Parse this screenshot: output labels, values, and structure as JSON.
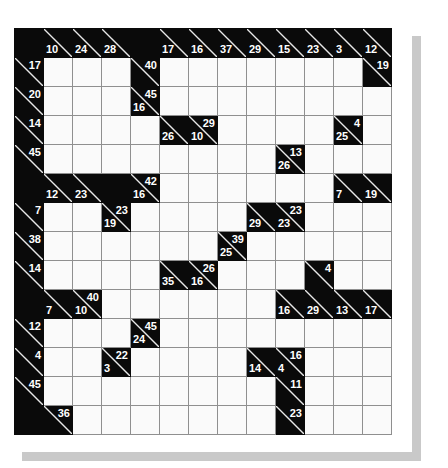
{
  "puzzle": {
    "type": "kakuro",
    "title": "Kakuro Grid",
    "rows": 14,
    "cols": 13,
    "cell_size_px": 29,
    "colors": {
      "block": "#0a0a0a",
      "cell": "#fafafa",
      "grid_line": "#8f8f8f",
      "clue_text": "#ffffff",
      "shadow": "#c9c9c9",
      "page_background": "#ffffff"
    },
    "legend": {
      "right_clue_note": "number in upper-right of a black cell is the sum of the horizontal run to its right",
      "down_clue_note": "number in lower-left of a black cell is the sum of the vertical run below it"
    },
    "grid": [
      [
        {
          "t": "block"
        },
        {
          "t": "clue",
          "down": "10"
        },
        {
          "t": "clue",
          "down": "24"
        },
        {
          "t": "clue",
          "down": "28"
        },
        {
          "t": "block"
        },
        {
          "t": "clue",
          "down": "17"
        },
        {
          "t": "clue",
          "down": "16"
        },
        {
          "t": "clue",
          "down": "37"
        },
        {
          "t": "clue",
          "down": "29"
        },
        {
          "t": "clue",
          "down": "15"
        },
        {
          "t": "clue",
          "down": "23"
        },
        {
          "t": "clue",
          "down": "3"
        },
        {
          "t": "clue",
          "down": "12"
        }
      ],
      [
        {
          "t": "clue",
          "right": "17"
        },
        {
          "t": "cell"
        },
        {
          "t": "cell"
        },
        {
          "t": "cell"
        },
        {
          "t": "clue",
          "right": "40"
        },
        {
          "t": "cell"
        },
        {
          "t": "cell"
        },
        {
          "t": "cell"
        },
        {
          "t": "cell"
        },
        {
          "t": "cell"
        },
        {
          "t": "cell"
        },
        {
          "t": "cell"
        },
        {
          "t": "clue",
          "right": "19"
        }
      ],
      [
        {
          "t": "clue",
          "right": "20"
        },
        {
          "t": "cell"
        },
        {
          "t": "cell"
        },
        {
          "t": "cell"
        },
        {
          "t": "clue",
          "right": "45",
          "down": "16"
        },
        {
          "t": "cell"
        },
        {
          "t": "cell"
        },
        {
          "t": "cell"
        },
        {
          "t": "cell"
        },
        {
          "t": "cell"
        },
        {
          "t": "cell"
        },
        {
          "t": "cell"
        },
        {
          "t": "cell"
        }
      ],
      [
        {
          "t": "clue",
          "right": "14"
        },
        {
          "t": "cell"
        },
        {
          "t": "cell"
        },
        {
          "t": "cell"
        },
        {
          "t": "cell"
        },
        {
          "t": "clue",
          "down": "26"
        },
        {
          "t": "clue",
          "right": "29",
          "down": "10"
        },
        {
          "t": "cell"
        },
        {
          "t": "cell"
        },
        {
          "t": "cell"
        },
        {
          "t": "cell"
        },
        {
          "t": "clue",
          "right": "4",
          "down": "25"
        },
        {
          "t": "cell"
        }
      ],
      [
        {
          "t": "clue",
          "right": "45"
        },
        {
          "t": "cell"
        },
        {
          "t": "cell"
        },
        {
          "t": "cell"
        },
        {
          "t": "cell"
        },
        {
          "t": "cell"
        },
        {
          "t": "cell"
        },
        {
          "t": "cell"
        },
        {
          "t": "cell"
        },
        {
          "t": "clue",
          "right": "13",
          "down": "26"
        },
        {
          "t": "cell"
        },
        {
          "t": "cell"
        },
        {
          "t": "cell"
        }
      ],
      [
        {
          "t": "block"
        },
        {
          "t": "clue",
          "down": "12"
        },
        {
          "t": "clue",
          "down": "23"
        },
        {
          "t": "block"
        },
        {
          "t": "clue",
          "right": "42",
          "down": "16"
        },
        {
          "t": "cell"
        },
        {
          "t": "cell"
        },
        {
          "t": "cell"
        },
        {
          "t": "cell"
        },
        {
          "t": "cell"
        },
        {
          "t": "cell"
        },
        {
          "t": "clue",
          "down": "7"
        },
        {
          "t": "clue",
          "down": "19"
        }
      ],
      [
        {
          "t": "clue",
          "right": "7"
        },
        {
          "t": "cell"
        },
        {
          "t": "cell"
        },
        {
          "t": "clue",
          "right": "23",
          "down": "19"
        },
        {
          "t": "cell"
        },
        {
          "t": "cell"
        },
        {
          "t": "cell"
        },
        {
          "t": "cell"
        },
        {
          "t": "clue",
          "down": "29"
        },
        {
          "t": "clue",
          "right": "23",
          "down": "23"
        },
        {
          "t": "cell"
        },
        {
          "t": "cell"
        },
        {
          "t": "cell"
        }
      ],
      [
        {
          "t": "clue",
          "right": "38"
        },
        {
          "t": "cell"
        },
        {
          "t": "cell"
        },
        {
          "t": "cell"
        },
        {
          "t": "cell"
        },
        {
          "t": "cell"
        },
        {
          "t": "cell"
        },
        {
          "t": "clue",
          "right": "39",
          "down": "25"
        },
        {
          "t": "cell"
        },
        {
          "t": "cell"
        },
        {
          "t": "cell"
        },
        {
          "t": "cell"
        },
        {
          "t": "cell"
        }
      ],
      [
        {
          "t": "clue",
          "right": "14"
        },
        {
          "t": "cell"
        },
        {
          "t": "cell"
        },
        {
          "t": "cell"
        },
        {
          "t": "cell"
        },
        {
          "t": "clue",
          "down": "35"
        },
        {
          "t": "clue",
          "right": "26",
          "down": "16"
        },
        {
          "t": "cell"
        },
        {
          "t": "cell"
        },
        {
          "t": "cell"
        },
        {
          "t": "clue",
          "right": "4"
        },
        {
          "t": "cell"
        },
        {
          "t": "cell"
        }
      ],
      [
        {
          "t": "block"
        },
        {
          "t": "clue",
          "down": "7"
        },
        {
          "t": "clue",
          "right": "40",
          "down": "10"
        },
        {
          "t": "cell"
        },
        {
          "t": "cell"
        },
        {
          "t": "cell"
        },
        {
          "t": "cell"
        },
        {
          "t": "cell"
        },
        {
          "t": "cell"
        },
        {
          "t": "clue",
          "down": "16"
        },
        {
          "t": "clue",
          "down": "29"
        },
        {
          "t": "clue",
          "down": "13"
        },
        {
          "t": "clue",
          "down": "17"
        }
      ],
      [
        {
          "t": "clue",
          "right": "12"
        },
        {
          "t": "cell"
        },
        {
          "t": "cell"
        },
        {
          "t": "cell"
        },
        {
          "t": "clue",
          "right": "45",
          "down": "24"
        },
        {
          "t": "cell"
        },
        {
          "t": "cell"
        },
        {
          "t": "cell"
        },
        {
          "t": "cell"
        },
        {
          "t": "cell"
        },
        {
          "t": "cell"
        },
        {
          "t": "cell"
        },
        {
          "t": "cell"
        }
      ],
      [
        {
          "t": "clue",
          "right": "4"
        },
        {
          "t": "cell"
        },
        {
          "t": "cell"
        },
        {
          "t": "clue",
          "right": "22",
          "down": "3"
        },
        {
          "t": "cell"
        },
        {
          "t": "cell"
        },
        {
          "t": "cell"
        },
        {
          "t": "cell"
        },
        {
          "t": "clue",
          "down": "14"
        },
        {
          "t": "clue",
          "right": "16",
          "down": "4"
        },
        {
          "t": "cell"
        },
        {
          "t": "cell"
        },
        {
          "t": "cell"
        }
      ],
      [
        {
          "t": "clue",
          "right": "45"
        },
        {
          "t": "cell"
        },
        {
          "t": "cell"
        },
        {
          "t": "cell"
        },
        {
          "t": "cell"
        },
        {
          "t": "cell"
        },
        {
          "t": "cell"
        },
        {
          "t": "cell"
        },
        {
          "t": "cell"
        },
        {
          "t": "clue",
          "right": "11"
        },
        {
          "t": "cell"
        },
        {
          "t": "cell"
        },
        {
          "t": "cell"
        }
      ],
      [
        {
          "t": "block"
        },
        {
          "t": "clue",
          "right": "36"
        },
        {
          "t": "cell"
        },
        {
          "t": "cell"
        },
        {
          "t": "cell"
        },
        {
          "t": "cell"
        },
        {
          "t": "cell"
        },
        {
          "t": "cell"
        },
        {
          "t": "cell"
        },
        {
          "t": "clue",
          "right": "23"
        },
        {
          "t": "cell"
        },
        {
          "t": "cell"
        },
        {
          "t": "cell"
        }
      ]
    ]
  }
}
